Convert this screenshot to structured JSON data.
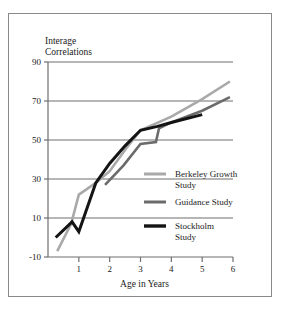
{
  "chart_data": {
    "type": "line",
    "title": "",
    "ylabel_line1": "Interage",
    "ylabel_line2": "Correlations",
    "xlabel": "Age in Years",
    "xlim": [
      0,
      6
    ],
    "ylim": [
      -10,
      90
    ],
    "xticks": [
      1,
      2,
      3,
      4,
      5,
      6
    ],
    "xtick_labels": [
      "1",
      "2",
      "3",
      "4",
      "5",
      "6"
    ],
    "yticks": [
      -10,
      10,
      30,
      50,
      70,
      90
    ],
    "ytick_labels": [
      "-10",
      "10",
      "30",
      "50",
      "70",
      "90"
    ],
    "grid": "horizontal",
    "legend_position": "inside-right",
    "series": [
      {
        "name": "Berkeley Growth Study",
        "label_line1": "Berkeley Growth",
        "label_line2": "Study",
        "color": "#a9a9a9",
        "width": 2.6,
        "points": [
          [
            0.3,
            -7
          ],
          [
            0.75,
            7
          ],
          [
            1.0,
            22
          ],
          [
            1.55,
            28
          ],
          [
            2.0,
            34
          ],
          [
            2.55,
            46
          ],
          [
            3.0,
            55
          ],
          [
            4.0,
            62
          ],
          [
            5.0,
            71
          ],
          [
            5.9,
            80
          ]
        ]
      },
      {
        "name": "Guidance Study",
        "label_line1": "Guidance Study",
        "label_line2": "",
        "color": "#6b6b6b",
        "width": 2.6,
        "points": [
          [
            1.85,
            27
          ],
          [
            2.45,
            37
          ],
          [
            3.0,
            48
          ],
          [
            3.5,
            49
          ],
          [
            3.6,
            56
          ],
          [
            4.0,
            59
          ],
          [
            5.0,
            65
          ],
          [
            5.9,
            72
          ]
        ]
      },
      {
        "name": "Stockholm Study",
        "label_line1": "Stockholm",
        "label_line2": "Study",
        "color": "#141414",
        "width": 3.0,
        "points": [
          [
            0.25,
            0
          ],
          [
            0.78,
            8
          ],
          [
            1.0,
            3
          ],
          [
            1.55,
            28
          ],
          [
            2.0,
            38
          ],
          [
            2.5,
            47
          ],
          [
            3.0,
            55
          ],
          [
            3.55,
            57
          ],
          [
            4.0,
            59
          ],
          [
            5.0,
            63
          ]
        ]
      }
    ],
    "legend_entries": [
      {
        "label_line1": "Berkeley Growth",
        "label_line2": "Study",
        "color": "#a9a9a9"
      },
      {
        "label_line1": "Guidance Study",
        "label_line2": "",
        "color": "#6b6b6b"
      },
      {
        "label_line1": "Stockholm",
        "label_line2": "Study",
        "color": "#141414"
      }
    ],
    "axis_color": "#6f6f6f",
    "grid_color": "#6f6f6f",
    "frame_color": "#8a8a8a"
  }
}
